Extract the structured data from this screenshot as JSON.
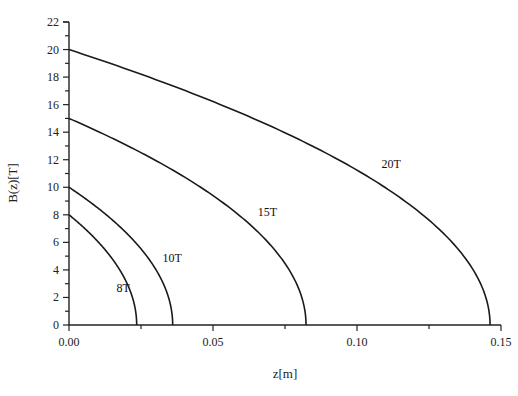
{
  "chart_data": {
    "type": "line",
    "title": "",
    "xlabel": "z[m]",
    "ylabel": "B(z)[T]",
    "xlim": [
      0.0,
      0.15
    ],
    "ylim": [
      0,
      22
    ],
    "x_ticks": [
      0.0,
      0.05,
      0.1,
      0.15
    ],
    "x_tick_labels": [
      "0.00",
      "0.05",
      "0.10",
      "0.15"
    ],
    "x_minor_ticks": [
      0.025,
      0.075,
      0.125
    ],
    "y_ticks": [
      0,
      2,
      4,
      6,
      8,
      10,
      12,
      14,
      16,
      18,
      20,
      22
    ],
    "y_tick_labels": [
      "0",
      "2",
      "4",
      "6",
      "8",
      "10",
      "12",
      "14",
      "16",
      "18",
      "20",
      "22"
    ],
    "grid": false,
    "legend": "inline curve labels",
    "series": [
      {
        "name": "8T",
        "B0": 8,
        "z_end": 0.0235,
        "x": [
          0.0,
          0.004,
          0.008,
          0.012,
          0.016,
          0.019,
          0.021,
          0.0225,
          0.0232,
          0.0235
        ],
        "y": [
          8.0,
          7.3,
          6.5,
          5.59,
          4.49,
          3.48,
          2.61,
          1.66,
          0.9,
          0.0
        ],
        "label": "8T",
        "label_pos": [
          0.0165,
          2.4
        ]
      },
      {
        "name": "10T",
        "B0": 10,
        "z_end": 0.036,
        "x": [
          0.0,
          0.006,
          0.012,
          0.018,
          0.024,
          0.029,
          0.032,
          0.034,
          0.0353,
          0.036
        ],
        "y": [
          10.0,
          9.13,
          8.16,
          7.07,
          5.77,
          4.41,
          3.33,
          2.36,
          1.39,
          0.0
        ],
        "label": "10T",
        "label_pos": [
          0.0325,
          4.6
        ]
      },
      {
        "name": "15T",
        "B0": 15,
        "z_end": 0.0823,
        "x": [
          0.0,
          0.01,
          0.02,
          0.03,
          0.04,
          0.05,
          0.06,
          0.07,
          0.076,
          0.08,
          0.0815,
          0.0823
        ],
        "y": [
          15.0,
          14.04,
          13.02,
          11.93,
          10.72,
          9.37,
          7.8,
          5.8,
          4.15,
          2.5,
          1.48,
          0.0
        ],
        "label": "15T",
        "label_pos": [
          0.0655,
          7.9
        ]
      },
      {
        "name": "20T",
        "B0": 20,
        "z_end": 0.1462,
        "x": [
          0.0,
          0.015,
          0.03,
          0.045,
          0.06,
          0.075,
          0.09,
          0.105,
          0.12,
          0.13,
          0.138,
          0.143,
          0.1455,
          0.1462
        ],
        "y": [
          20.0,
          18.94,
          17.82,
          16.63,
          15.35,
          13.96,
          12.4,
          10.63,
          8.47,
          6.66,
          4.74,
          2.96,
          1.38,
          0.0
        ],
        "label": "20T",
        "label_pos": [
          0.1085,
          11.4
        ]
      }
    ]
  },
  "axes": {
    "x_title": "z[m]",
    "y_title": "B(z)[T]"
  }
}
